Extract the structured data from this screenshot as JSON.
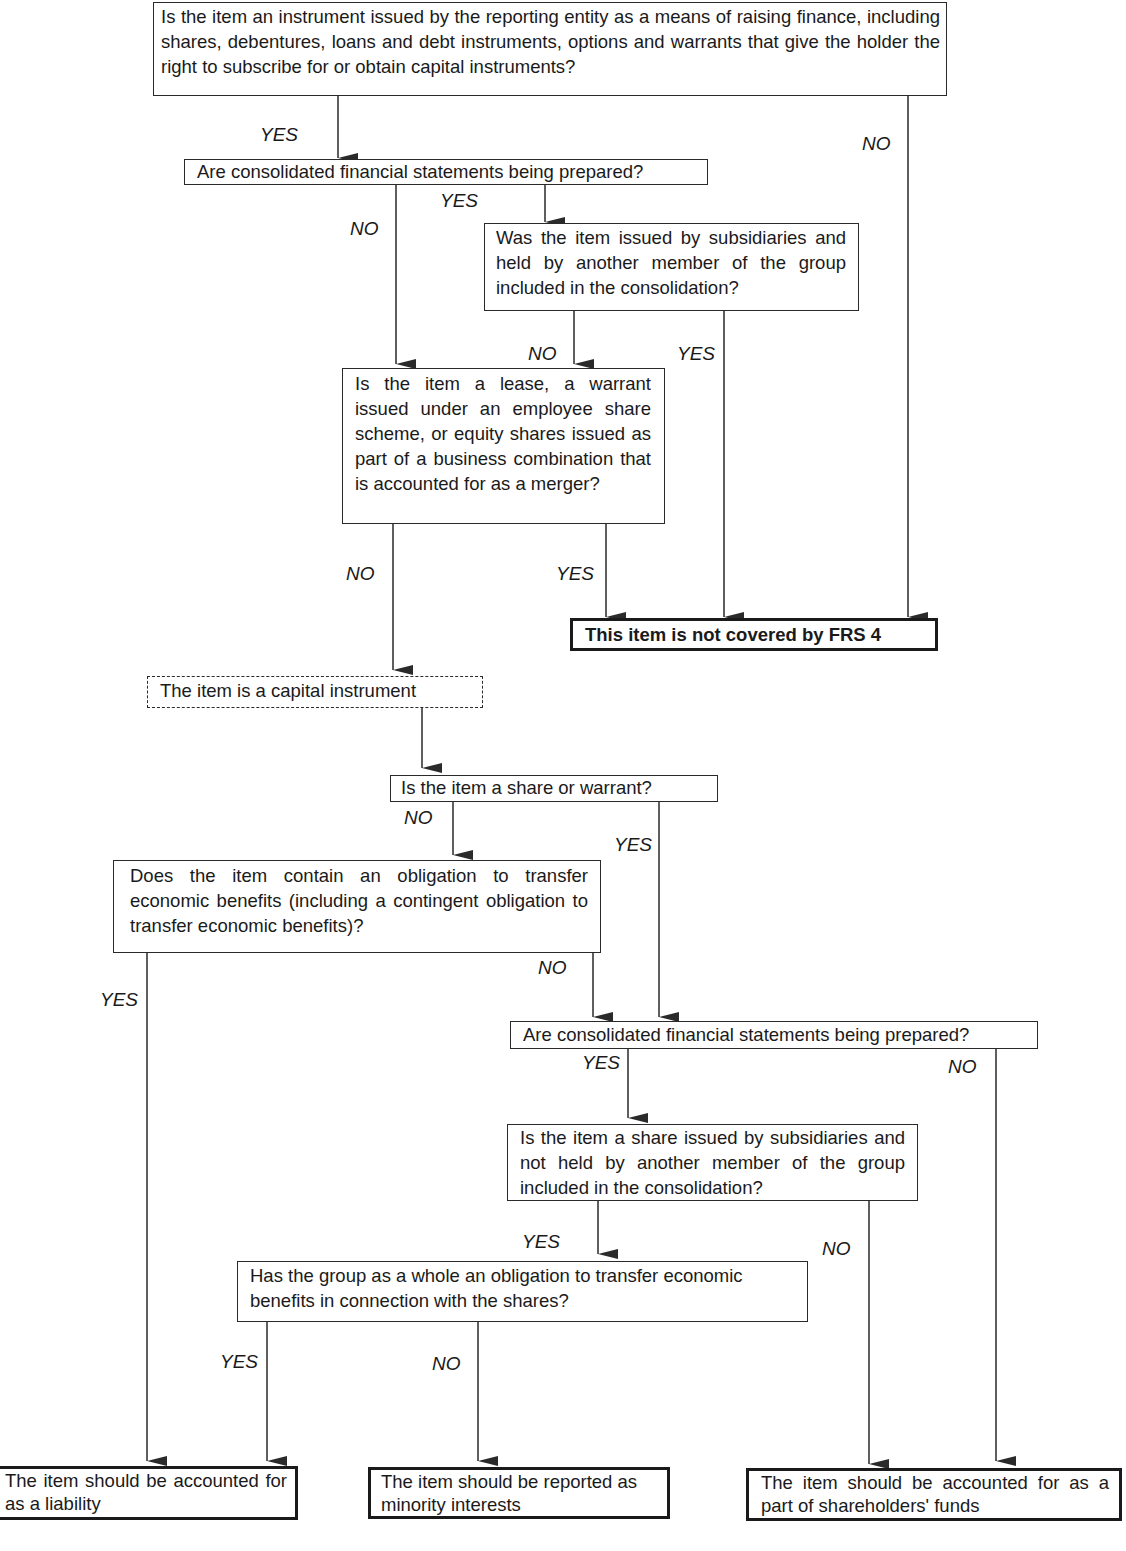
{
  "nodes": {
    "q_instrument": "Is the item an instrument issued by the reporting entity as a means of raising finance, including shares, debentures, loans and debt instruments, options and warrants that give the holder the right to subscribe for or obtain capital instruments?",
    "q_consolidated_1": "Are consolidated financial statements being prepared?",
    "q_subsidiaries_held": "Was the item issued by subsidiaries and held by another member of the group included in the consolidation?",
    "q_lease_warrant_merger": "Is the item a lease, a warrant issued under an employee share scheme, or equity shares issued as part of a business combination that is accounted for as a merger?",
    "r_not_covered": "This item is not covered by FRS 4",
    "s_capital_instrument": "The item is a capital instrument",
    "q_share_or_warrant": "Is the item a share or warrant?",
    "q_obligation": "Does the item contain an obligation to transfer economic benefits (including a contingent obligation to transfer economic benefits)?",
    "q_consolidated_2": "Are consolidated financial statements being prepared?",
    "q_subsidiaries_not_held": "Is the item a share issued by subsidiaries and not held by another member of the group included in the consolidation?",
    "q_group_obligation": "Has the group as a whole an obligation to transfer economic benefits in connection with the shares?",
    "r_liability": "The item should be accounted for as a liability",
    "r_minority": "The item should be reported as minority interests",
    "r_shareholders_funds": "The item should be accounted for as a part of shareholders' funds"
  },
  "edge_labels": {
    "instrument_yes": "YES",
    "instrument_no": "NO",
    "consolidated1_yes": "YES",
    "consolidated1_no": "NO",
    "subsidiaries_held_no": "NO",
    "subsidiaries_held_yes": "YES",
    "lease_no": "NO",
    "lease_yes": "YES",
    "share_warrant_no": "NO",
    "share_warrant_yes": "YES",
    "obligation_yes": "YES",
    "obligation_no": "NO",
    "consolidated2_yes": "YES",
    "consolidated2_no": "NO",
    "subsidiaries_not_held_yes": "YES",
    "subsidiaries_not_held_no": "NO",
    "group_obligation_yes": "YES",
    "group_obligation_no": "NO"
  },
  "colors": {
    "line": "#2a2a2a",
    "background": "#ffffff",
    "text": "#1a1a1a"
  }
}
